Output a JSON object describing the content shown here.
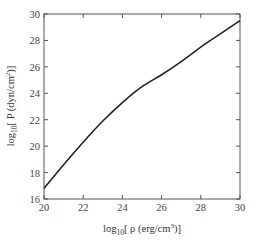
{
  "chart_data": {
    "type": "line",
    "title": "",
    "xlabel": "log10[ρ (erg/cm³)]",
    "ylabel": "log10[P (dyn/cm²)]",
    "xlim": [
      20,
      30
    ],
    "ylim": [
      16,
      30
    ],
    "x_ticks": [
      20,
      22,
      24,
      26,
      28,
      30
    ],
    "y_ticks": [
      16,
      18,
      20,
      22,
      24,
      26,
      28,
      30
    ],
    "grid": false,
    "legend": null,
    "series": [
      {
        "name": "P(ρ)",
        "x": [
          20,
          21,
          22,
          23,
          24,
          25,
          26,
          27,
          28,
          29,
          30
        ],
        "y": [
          16.8,
          18.6,
          20.3,
          21.9,
          23.3,
          24.5,
          25.4,
          26.4,
          27.5,
          28.5,
          29.5
        ],
        "color": "#222222"
      }
    ]
  },
  "labels": {
    "xlabel_prefix": "log",
    "xlabel_sub": "10",
    "xlabel_body": "[ ρ (erg/cm",
    "xlabel_sup": "3",
    "xlabel_end": ")]",
    "ylabel_prefix": "log",
    "ylabel_sub": "10",
    "ylabel_body": "[ P (dyn/cm",
    "ylabel_sup": "2",
    "ylabel_end": ")]"
  }
}
